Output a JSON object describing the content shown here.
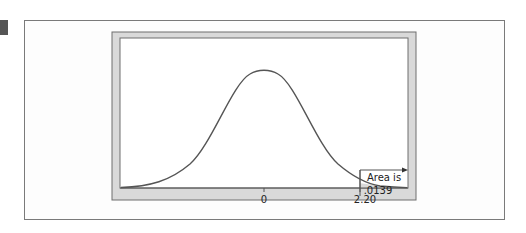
{
  "figure": {
    "marker_color": "#555555",
    "frame_color": "#d9d9d9",
    "plot_bg": "#ffffff",
    "shade_color": "#d9d9d9",
    "curve_color": "#555555"
  },
  "labels": {
    "tick_0": "0",
    "tick_cut": "2.20",
    "area_line1": "Area is",
    "area_line2": ".0139"
  },
  "chart_data": {
    "type": "area",
    "title": "",
    "xlabel": "",
    "ylabel": "",
    "x_ticks": [
      "0",
      "2.20"
    ],
    "curve": "standard normal density",
    "shaded_region": {
      "from": 2.2,
      "to": "infinity",
      "area": 0.0139
    },
    "annotation": "Area is .0139",
    "xlim": [
      -3.5,
      3.5
    ],
    "grid": false
  }
}
